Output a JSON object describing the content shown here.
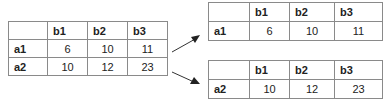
{
  "source_table": {
    "columns": [
      "",
      "b1",
      "b2",
      "b3"
    ],
    "rows": [
      {
        "label": "a1",
        "values": [
          "6",
          "10",
          "11"
        ]
      },
      {
        "label": "a2",
        "values": [
          "10",
          "12",
          "23"
        ]
      }
    ]
  },
  "split_tables": [
    {
      "columns": [
        "",
        "b1",
        "b2",
        "b3"
      ],
      "row": {
        "label": "a1",
        "values": [
          "6",
          "10",
          "11"
        ]
      }
    },
    {
      "columns": [
        "",
        "b1",
        "b2",
        "b3"
      ],
      "row": {
        "label": "a2",
        "values": [
          "10",
          "12",
          "23"
        ]
      }
    }
  ],
  "colors": {
    "border": "#8a8a8a",
    "arrow": "#333333",
    "text": "#222222"
  }
}
